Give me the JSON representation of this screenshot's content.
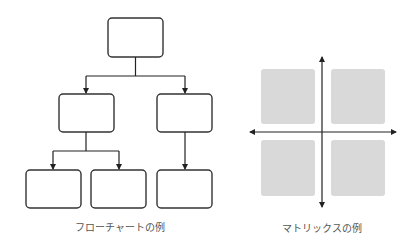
{
  "flowchart": {
    "caption": "フローチャートの例",
    "box_stroke": "#333333",
    "boxes": [
      {
        "id": "root",
        "x": 108,
        "y": 18,
        "w": 55,
        "h": 39
      },
      {
        "id": "mid-left",
        "x": 59,
        "y": 94,
        "w": 55,
        "h": 38
      },
      {
        "id": "mid-right",
        "x": 157,
        "y": 94,
        "w": 55,
        "h": 38
      },
      {
        "id": "leaf-1",
        "x": 26,
        "y": 170,
        "w": 55,
        "h": 38
      },
      {
        "id": "leaf-2",
        "x": 91,
        "y": 170,
        "w": 55,
        "h": 38
      },
      {
        "id": "leaf-3",
        "x": 157,
        "y": 170,
        "w": 55,
        "h": 38
      }
    ]
  },
  "matrix": {
    "caption": "マトリックスの例",
    "quadrant_fill": "#d9d9d9",
    "axis_color": "#222222"
  }
}
